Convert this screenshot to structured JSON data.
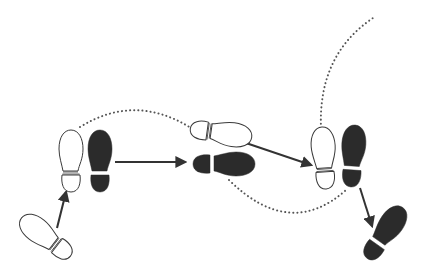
{
  "diagram": {
    "type": "dance-step-footprint-diagram",
    "colors": {
      "background": "#ffffff",
      "outline": "#3a3a3a",
      "filled_foot": "#2b2b2b",
      "open_foot": "#ffffff",
      "arrow": "#333333",
      "dotted_path": "#555555"
    },
    "legend": {
      "open_foot": "left foot (outline)",
      "filled_foot": "right foot (solid)"
    },
    "footprints": [
      {
        "id": 1,
        "foot": "left",
        "style": "outline",
        "cx": 46,
        "cy": 237,
        "rotation": -52
      },
      {
        "id": 2,
        "foot": "left",
        "style": "outline",
        "cx": 71,
        "cy": 161,
        "rotation": 0
      },
      {
        "id": 3,
        "foot": "right",
        "style": "filled",
        "cx": 100,
        "cy": 161,
        "rotation": 0
      },
      {
        "id": 4,
        "foot": "left",
        "style": "outline",
        "cx": 221,
        "cy": 133,
        "rotation": 98
      },
      {
        "id": 5,
        "foot": "right",
        "style": "filled",
        "cx": 224,
        "cy": 164,
        "rotation": 90
      },
      {
        "id": 6,
        "foot": "left",
        "style": "outline",
        "cx": 324,
        "cy": 158,
        "rotation": -4
      },
      {
        "id": 7,
        "foot": "right",
        "style": "filled",
        "cx": 353,
        "cy": 156,
        "rotation": 4
      },
      {
        "id": 8,
        "foot": "right",
        "style": "filled",
        "cx": 385,
        "cy": 233,
        "rotation": 35
      }
    ],
    "arrows": [
      {
        "from": [
          57,
          228
        ],
        "to": [
          66,
          192
        ]
      },
      {
        "from": [
          115,
          162
        ],
        "to": [
          185,
          162
        ]
      },
      {
        "from": [
          243,
          142
        ],
        "to": [
          311,
          165
        ]
      },
      {
        "from": [
          360,
          188
        ],
        "to": [
          372,
          226
        ]
      }
    ],
    "dotted_paths": [
      {
        "d": "M80,127 Q135,93 191,128"
      },
      {
        "d": "M229,180 Q290,240 346,190"
      },
      {
        "d": "M321,128 Q318,55 373,18"
      }
    ]
  }
}
